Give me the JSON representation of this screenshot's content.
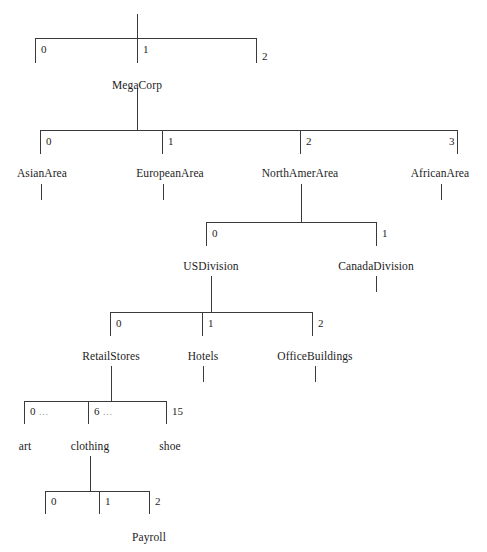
{
  "diagram": {
    "type": "indexed-array-hierarchy-tree",
    "line_color": "#3a3a3a",
    "text_color": "#1c1c1c",
    "ellipsis_color": "#9a9a9a",
    "background": "#ffffff",
    "ellipsis_glyph": "…",
    "levels": [
      {
        "id": "level-0",
        "bar_y": 38,
        "stem_x": 137,
        "stem_top": 14,
        "bar_left": 35,
        "bar_right": 257,
        "tick_bottom": 63,
        "index_y": 44,
        "slots": [
          {
            "index": "0",
            "x": 35,
            "side": "right",
            "ellipsis": false
          },
          {
            "index": "1",
            "x": 137,
            "side": "right",
            "ellipsis": false
          },
          {
            "index": "2",
            "x": 257,
            "side": "left",
            "ellipsis": false
          }
        ],
        "node": {
          "label": "MegaCorp",
          "x": 137,
          "y": 80,
          "from_index": "1"
        }
      },
      {
        "id": "level-1",
        "bar_y": 130,
        "stem_x": 137,
        "stem_top": 96,
        "bar_left": 40,
        "bar_right": 458,
        "tick_bottom": 154,
        "index_y": 136,
        "slots": [
          {
            "index": "0",
            "x": 40,
            "side": "right",
            "ellipsis": false
          },
          {
            "index": "1",
            "x": 162,
            "side": "right",
            "ellipsis": false
          },
          {
            "index": "2",
            "x": 300,
            "side": "right",
            "ellipsis": false
          },
          {
            "index": "3",
            "x": 458,
            "side": "left",
            "ellipsis": false
          }
        ],
        "nodes": [
          {
            "label": "AsianArea",
            "x": 42,
            "y": 170,
            "from_index": "0",
            "stub_top": 184,
            "stub_bottom": 200,
            "expanded": false
          },
          {
            "label": "EuropeanArea",
            "x": 170,
            "y": 170,
            "from_index": "1",
            "stub_top": 184,
            "stub_bottom": 200,
            "expanded": false
          },
          {
            "label": "NorthAmerArea",
            "x": 300,
            "y": 170,
            "from_index": "2",
            "stub_top": 184,
            "stub_bottom": 200,
            "expanded": true
          },
          {
            "label": "AfricanArea",
            "x": 440,
            "y": 170,
            "from_index": "3",
            "stub_top": 184,
            "stub_bottom": 200,
            "expanded": false
          }
        ]
      },
      {
        "id": "level-2",
        "bar_y": 222,
        "stem_x": 302,
        "stem_top": 190,
        "bar_left": 206,
        "bar_right": 377,
        "tick_bottom": 246,
        "index_y": 228,
        "slots": [
          {
            "index": "0",
            "x": 206,
            "side": "right",
            "ellipsis": false
          },
          {
            "index": "1",
            "x": 377,
            "side": "right",
            "ellipsis": false
          }
        ],
        "nodes": [
          {
            "label": "USDivision",
            "x": 211,
            "y": 263,
            "from_index": "0",
            "stub_top": 276,
            "stub_bottom": 292,
            "expanded": true
          },
          {
            "label": "CanadaDivision",
            "x": 376,
            "y": 263,
            "from_index": "1",
            "stub_top": 276,
            "stub_bottom": 292,
            "expanded": false
          }
        ]
      },
      {
        "id": "level-3",
        "bar_y": 312,
        "stem_x": 211,
        "stem_top": 282,
        "bar_left": 110,
        "bar_right": 313,
        "tick_bottom": 336,
        "index_y": 318,
        "slots": [
          {
            "index": "0",
            "x": 110,
            "side": "right",
            "ellipsis": false
          },
          {
            "index": "1",
            "x": 202,
            "side": "right",
            "ellipsis": false
          },
          {
            "index": "2",
            "x": 313,
            "side": "right",
            "ellipsis": false
          }
        ],
        "nodes": [
          {
            "label": "RetailStores",
            "x": 111,
            "y": 353,
            "from_index": "0",
            "stub_top": 366,
            "stub_bottom": 382,
            "expanded": true
          },
          {
            "label": "Hotels",
            "x": 203,
            "y": 353,
            "from_index": "1",
            "stub_top": 366,
            "stub_bottom": 382,
            "expanded": false
          },
          {
            "label": "OfficeBuildings",
            "x": 315,
            "y": 353,
            "from_index": "2",
            "stub_top": 366,
            "stub_bottom": 382,
            "expanded": false
          }
        ]
      },
      {
        "id": "level-4",
        "bar_y": 401,
        "stem_x": 111,
        "stem_top": 378,
        "bar_left": 24,
        "bar_right": 167,
        "tick_bottom": 424,
        "index_y": 406,
        "slots": [
          {
            "index": "0",
            "x": 24,
            "side": "right",
            "ellipsis": true
          },
          {
            "index": "6",
            "x": 88,
            "side": "right",
            "ellipsis": true
          },
          {
            "index": "15",
            "x": 167,
            "side": "right",
            "ellipsis": false
          }
        ],
        "nodes": [
          {
            "label": "art",
            "x": 25,
            "y": 443,
            "from_index": "0",
            "stub_top": 0,
            "stub_bottom": 0,
            "expanded": false
          },
          {
            "label": "clothing",
            "x": 90,
            "y": 443,
            "from_index": "6",
            "stub_top": 456,
            "stub_bottom": 472,
            "expanded": true
          },
          {
            "label": "shoe",
            "x": 170,
            "y": 443,
            "from_index": "15",
            "stub_top": 0,
            "stub_bottom": 0,
            "expanded": false
          }
        ]
      },
      {
        "id": "level-5",
        "bar_y": 491,
        "stem_x": 90,
        "stem_top": 468,
        "bar_left": 45,
        "bar_right": 150,
        "tick_bottom": 514,
        "index_y": 496,
        "slots": [
          {
            "index": "0",
            "x": 45,
            "side": "right",
            "ellipsis": false
          },
          {
            "index": "1",
            "x": 99,
            "side": "right",
            "ellipsis": false
          },
          {
            "index": "2",
            "x": 150,
            "side": "right",
            "ellipsis": false
          }
        ],
        "nodes": [
          {
            "label": "Payroll",
            "x": 149,
            "y": 534,
            "from_index": "2",
            "stub_top": 0,
            "stub_bottom": 0,
            "expanded": false
          }
        ]
      }
    ]
  }
}
